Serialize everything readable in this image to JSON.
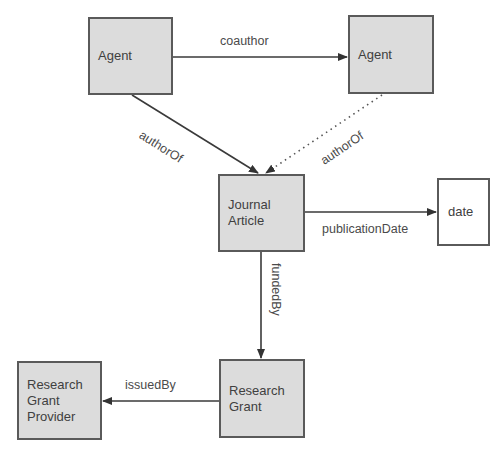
{
  "diagram": {
    "type": "entity-relationship graph",
    "nodes": [
      {
        "id": "agent1",
        "label": "Agent",
        "style": "class",
        "box": [
          88,
          17,
          85,
          78
        ]
      },
      {
        "id": "agent2",
        "label": "Agent",
        "style": "class",
        "box": [
          348,
          15,
          86,
          79
        ]
      },
      {
        "id": "journal_article",
        "label": "Journal\nArticle",
        "style": "class",
        "box": [
          218,
          174,
          87,
          78
        ]
      },
      {
        "id": "date",
        "label": "date",
        "style": "literal",
        "box": [
          437,
          178,
          53,
          68
        ]
      },
      {
        "id": "research_grant",
        "label": "Research\nGrant",
        "style": "class",
        "box": [
          219,
          359,
          86,
          79
        ]
      },
      {
        "id": "research_grant_provider",
        "label": "Research\nGrant\nProvider",
        "style": "class",
        "box": [
          17,
          361,
          85,
          79
        ]
      }
    ],
    "edges": [
      {
        "id": "coauthor",
        "from": "agent1",
        "to": "agent2",
        "label": "coauthor",
        "line": "solid"
      },
      {
        "id": "authorOf1",
        "from": "agent1",
        "to": "journal_article",
        "label": "authorOf",
        "line": "solid"
      },
      {
        "id": "authorOf2",
        "from": "agent2",
        "to": "journal_article",
        "label": "authorOf",
        "line": "dotted"
      },
      {
        "id": "publicationDate",
        "from": "journal_article",
        "to": "date",
        "label": "publicationDate",
        "line": "solid"
      },
      {
        "id": "fundedBy",
        "from": "journal_article",
        "to": "research_grant",
        "label": "fundedBy",
        "line": "solid"
      },
      {
        "id": "issuedBy",
        "from": "research_grant",
        "to": "research_grant_provider",
        "label": "issuedBy",
        "line": "solid"
      }
    ],
    "colors": {
      "node_fill": "#dcdcdc",
      "literal_fill": "#ffffff",
      "border": "#5a5a5a",
      "edge": "#3a3a3a",
      "text": "#404040"
    }
  }
}
